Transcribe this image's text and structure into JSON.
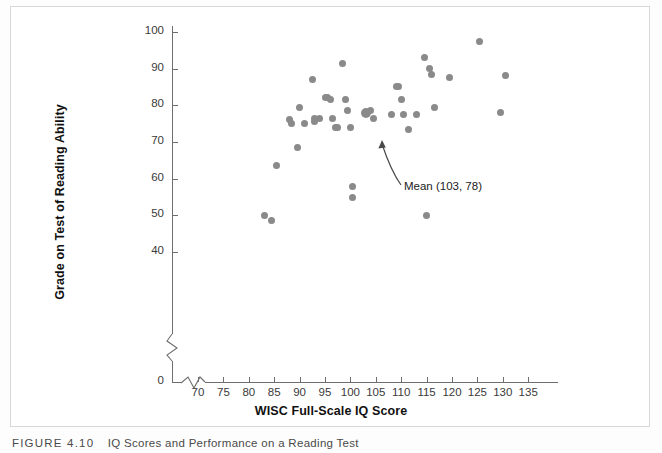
{
  "figure": {
    "caption_number": "FIGURE 4.10",
    "caption_text": "IQ Scores and Performance on a Reading Test"
  },
  "chart_data": {
    "type": "scatter",
    "title": "",
    "xlabel": "WISC Full-Scale IQ Score",
    "ylabel": "Grade on Test of Reading Ability",
    "xlim": [
      66,
      138
    ],
    "ylim": [
      40,
      102
    ],
    "x_ticks": [
      70,
      75,
      80,
      85,
      90,
      95,
      100,
      105,
      110,
      115,
      120,
      125,
      130,
      135
    ],
    "y_ticks": [
      40,
      50,
      60,
      70,
      80,
      90,
      100
    ],
    "y_axis_break": true,
    "y_origin_label": "0",
    "grid": false,
    "legend": null,
    "marker_color": "#8a8a8a",
    "points": [
      {
        "x": 83.0,
        "y": 50.0
      },
      {
        "x": 84.5,
        "y": 48.5
      },
      {
        "x": 85.5,
        "y": 63.5
      },
      {
        "x": 88.0,
        "y": 76.0
      },
      {
        "x": 88.5,
        "y": 75.0
      },
      {
        "x": 89.5,
        "y": 68.5
      },
      {
        "x": 90.0,
        "y": 79.5
      },
      {
        "x": 91.0,
        "y": 75.0
      },
      {
        "x": 92.5,
        "y": 87.0
      },
      {
        "x": 93.0,
        "y": 76.5
      },
      {
        "x": 93.0,
        "y": 75.5
      },
      {
        "x": 94.0,
        "y": 76.5
      },
      {
        "x": 95.0,
        "y": 82.0
      },
      {
        "x": 95.5,
        "y": 82.0
      },
      {
        "x": 96.0,
        "y": 81.5
      },
      {
        "x": 96.5,
        "y": 76.5
      },
      {
        "x": 97.0,
        "y": 74.0
      },
      {
        "x": 97.5,
        "y": 74.0
      },
      {
        "x": 98.5,
        "y": 91.5
      },
      {
        "x": 99.0,
        "y": 81.5
      },
      {
        "x": 99.5,
        "y": 78.5
      },
      {
        "x": 100.0,
        "y": 74.0
      },
      {
        "x": 100.5,
        "y": 58.0
      },
      {
        "x": 100.5,
        "y": 55.0
      },
      {
        "x": 103.0,
        "y": 78.0
      },
      {
        "x": 104.0,
        "y": 78.5
      },
      {
        "x": 104.5,
        "y": 76.5
      },
      {
        "x": 108.0,
        "y": 77.5
      },
      {
        "x": 109.0,
        "y": 85.0
      },
      {
        "x": 109.5,
        "y": 85.0
      },
      {
        "x": 110.0,
        "y": 81.5
      },
      {
        "x": 110.5,
        "y": 77.5
      },
      {
        "x": 111.5,
        "y": 73.5
      },
      {
        "x": 113.0,
        "y": 77.5
      },
      {
        "x": 114.5,
        "y": 93.0
      },
      {
        "x": 115.0,
        "y": 50.0
      },
      {
        "x": 115.5,
        "y": 90.0
      },
      {
        "x": 116.0,
        "y": 88.5
      },
      {
        "x": 116.5,
        "y": 79.5
      },
      {
        "x": 119.5,
        "y": 87.5
      },
      {
        "x": 125.5,
        "y": 97.5
      },
      {
        "x": 129.5,
        "y": 78.0
      },
      {
        "x": 130.5,
        "y": 88.0
      }
    ],
    "highlight_point": {
      "x": 103,
      "y": 78,
      "label": "Mean (103, 78)"
    },
    "annotations": [
      {
        "text": "Mean (103, 78)",
        "points_to_x": 103,
        "points_to_y": 78
      }
    ]
  }
}
